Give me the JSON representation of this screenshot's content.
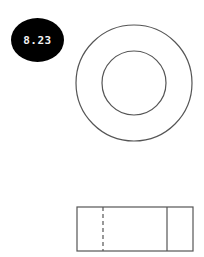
{
  "figure": {
    "label": "8.23",
    "badge_color": "#000000",
    "badge_text_color": "#f2f2f2",
    "line_color": "#555555"
  },
  "top_view": {
    "outer_circle": {
      "cx": 134,
      "cy": 83,
      "r": 58
    },
    "inner_circle": {
      "cx": 134,
      "cy": 83,
      "r": 32
    }
  },
  "front_view": {
    "rect": {
      "x": 77,
      "y": 207,
      "width": 116,
      "height": 44
    },
    "hidden_line_x": 103,
    "visible_line_x": 167
  }
}
